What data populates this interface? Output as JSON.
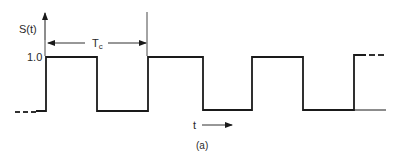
{
  "figure": {
    "y_axis_label": "S(t)",
    "y_level_label": "1.0",
    "period_label": "T",
    "period_subscript": "c",
    "x_axis_label": "t",
    "caption": "(a)"
  },
  "colors": {
    "ink": "#1a1a1a",
    "background": "#ffffff"
  },
  "waveform": {
    "type": "square-wave",
    "high": 1.0,
    "low": 0,
    "pulses_px": [
      [
        46,
        97
      ],
      [
        148,
        203
      ],
      [
        252,
        303
      ],
      [
        354,
        385
      ]
    ],
    "high_y_px": 57,
    "low_y_px": 111
  }
}
